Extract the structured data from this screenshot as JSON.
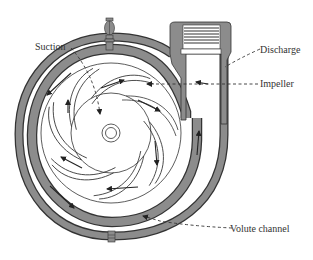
{
  "diagram": {
    "labels": {
      "suction": "Suction",
      "discharge": "Discharge",
      "impeller": "Impeller",
      "volute": "Volute channel"
    },
    "colors": {
      "casing": "#8c8c8c",
      "outline": "#333333",
      "background": "#ffffff"
    },
    "components": [
      "casing",
      "volute-channel",
      "impeller",
      "impeller-vanes",
      "eye-hub",
      "discharge-nozzle",
      "threaded-flange",
      "top-vent-plug",
      "bottom-drain-plug"
    ]
  }
}
